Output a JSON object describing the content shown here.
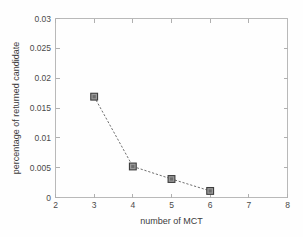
{
  "chart_data": {
    "type": "line",
    "title": "",
    "xlabel": "number of MCT",
    "ylabel": "percentage of returned candidate",
    "x": [
      3,
      4,
      5,
      6
    ],
    "values": [
      0.0169,
      0.0052,
      0.0031,
      0.0011
    ],
    "series": [
      {
        "name": "percentage of returned candidate",
        "x": [
          3,
          4,
          5,
          6
        ],
        "values": [
          0.0169,
          0.0052,
          0.0031,
          0.0011
        ]
      }
    ],
    "xlim": [
      2,
      8
    ],
    "ylim": [
      0,
      0.03
    ],
    "xticks": [
      "2",
      "3",
      "4",
      "5",
      "6",
      "7",
      "8"
    ],
    "xtick_values": [
      2,
      3,
      4,
      5,
      6,
      7,
      8
    ],
    "yticks": [
      "0",
      "0.005",
      "0.01",
      "0.015",
      "0.02",
      "0.025",
      "0.03"
    ],
    "ytick_values": [
      0,
      0.005,
      0.01,
      0.015,
      0.02,
      0.025,
      0.03
    ],
    "grid": false,
    "legend": null,
    "legend_position": "none",
    "line_style": "dashed",
    "marker": "square",
    "line_color": "#6e6e6e",
    "marker_fill": "#9a9a9a",
    "marker_edge": "#3d3d3d",
    "axis_color": "#b9b9b9",
    "background_color": "#ffffff",
    "annotations": []
  },
  "axes": {
    "x_title": "number of MCT",
    "y_title": "percentage of returned candidate"
  },
  "xtick": {
    "l0": "2",
    "l1": "3",
    "l2": "4",
    "l3": "5",
    "l4": "6",
    "l5": "7",
    "l6": "8"
  },
  "ytick": {
    "l0": "0",
    "l1": "0.005",
    "l2": "0.01",
    "l3": "0.015",
    "l4": "0.02",
    "l5": "0.025",
    "l6": "0.03"
  }
}
